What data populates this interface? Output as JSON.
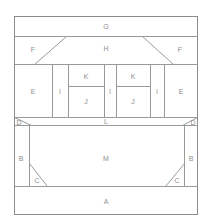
{
  "diagram": {
    "stroke_color": "#9a9a9a",
    "background_color": "#ffffff",
    "label_color": "#8f8f8f",
    "width": 212,
    "height": 219,
    "regions": [
      {
        "id": "G",
        "label": "G",
        "shape": "rectangle",
        "cx": 106,
        "cy": 26,
        "x": 14,
        "y": 16,
        "w": 184,
        "h": 20
      },
      {
        "id": "F_left",
        "label": "F",
        "shape": "trapezoid",
        "cx": 33,
        "cy": 49,
        "x": 14,
        "y": 36,
        "w": 52,
        "h": 26
      },
      {
        "id": "H",
        "label": "H",
        "shape": "trapezoid",
        "cx": 106,
        "cy": 48,
        "x": 34,
        "y": 36,
        "w": 144,
        "h": 26
      },
      {
        "id": "F_right",
        "label": "F",
        "shape": "trapezoid",
        "cx": 180,
        "cy": 49,
        "x": 142,
        "y": 36,
        "w": 56,
        "h": 26
      },
      {
        "id": "E_left",
        "label": "E",
        "shape": "rectangle",
        "cx": 33,
        "cy": 91,
        "x": 14,
        "y": 65,
        "w": 38,
        "h": 52
      },
      {
        "id": "I_1",
        "label": "I",
        "shape": "rectangle",
        "cx": 60,
        "cy": 91,
        "x": 52,
        "y": 65,
        "w": 16,
        "h": 52
      },
      {
        "id": "K_1",
        "label": "K",
        "shape": "rectangle",
        "cx": 86,
        "cy": 79,
        "x": 68,
        "y": 65,
        "w": 36,
        "h": 21
      },
      {
        "id": "J_1",
        "label": "J",
        "shape": "rectangle",
        "cx": 86,
        "cy": 101,
        "x": 68,
        "y": 86,
        "w": 36,
        "h": 31
      },
      {
        "id": "I_2",
        "label": "I",
        "shape": "rectangle",
        "cx": 110,
        "cy": 91,
        "x": 104,
        "y": 65,
        "w": 12,
        "h": 52
      },
      {
        "id": "K_2",
        "label": "K",
        "shape": "rectangle",
        "cx": 133,
        "cy": 79,
        "x": 116,
        "y": 65,
        "w": 34,
        "h": 21
      },
      {
        "id": "J_2",
        "label": "J",
        "shape": "rectangle",
        "cx": 133,
        "cy": 101,
        "x": 116,
        "y": 86,
        "w": 34,
        "h": 31
      },
      {
        "id": "I_3",
        "label": "I",
        "shape": "rectangle",
        "cx": 157,
        "cy": 91,
        "x": 150,
        "y": 65,
        "w": 14,
        "h": 52
      },
      {
        "id": "E_right",
        "label": "E",
        "shape": "rectangle",
        "cx": 181,
        "cy": 91,
        "x": 164,
        "y": 65,
        "w": 34,
        "h": 52
      },
      {
        "id": "D_left",
        "label": "D",
        "shape": "triangle",
        "cx": 18,
        "cy": 120,
        "x": 14,
        "y": 117,
        "w": 18,
        "h": 8
      },
      {
        "id": "L",
        "label": "L",
        "shape": "trapezoid",
        "cx": 106,
        "cy": 121,
        "x": 14,
        "y": 117,
        "w": 184,
        "h": 8
      },
      {
        "id": "D_right",
        "label": "D",
        "shape": "triangle",
        "cx": 194,
        "cy": 120,
        "x": 180,
        "y": 117,
        "w": 18,
        "h": 8
      },
      {
        "id": "B_left",
        "label": "B",
        "shape": "rectangle",
        "cx": 21,
        "cy": 160,
        "x": 14,
        "y": 125,
        "w": 15,
        "h": 61
      },
      {
        "id": "M",
        "label": "M",
        "shape": "polygon",
        "cx": 106,
        "cy": 158,
        "x": 29,
        "y": 125,
        "w": 156,
        "h": 61
      },
      {
        "id": "C_left",
        "label": "C",
        "shape": "triangle",
        "cx": 37,
        "cy": 180,
        "x": 29,
        "y": 163,
        "w": 18,
        "h": 23
      },
      {
        "id": "C_right",
        "label": "C",
        "shape": "triangle",
        "cx": 176,
        "cy": 180,
        "x": 165,
        "y": 163,
        "w": 20,
        "h": 23
      },
      {
        "id": "B_right",
        "label": "B",
        "shape": "rectangle",
        "cx": 191,
        "cy": 160,
        "x": 185,
        "y": 125,
        "w": 13,
        "h": 61
      },
      {
        "id": "A",
        "label": "A",
        "shape": "rectangle",
        "cx": 106,
        "cy": 201,
        "x": 14,
        "y": 186,
        "w": 184,
        "h": 29
      }
    ]
  }
}
